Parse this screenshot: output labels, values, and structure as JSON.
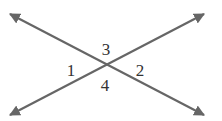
{
  "diagram": {
    "type": "intersecting-lines",
    "line_color": "#666666",
    "label_color": "#333333",
    "lines": [
      {
        "name": "line-a",
        "from": [
          10,
          14
        ],
        "to": [
          204,
          115
        ]
      },
      {
        "name": "line-b",
        "from": [
          10,
          115
        ],
        "to": [
          204,
          14
        ]
      }
    ],
    "intersection": [
      106,
      66
    ],
    "angle_labels": [
      {
        "text": "1",
        "x": 71,
        "y": 76
      },
      {
        "text": "2",
        "x": 140,
        "y": 76
      },
      {
        "text": "3",
        "x": 106,
        "y": 55
      },
      {
        "text": "4",
        "x": 105,
        "y": 91
      }
    ]
  }
}
